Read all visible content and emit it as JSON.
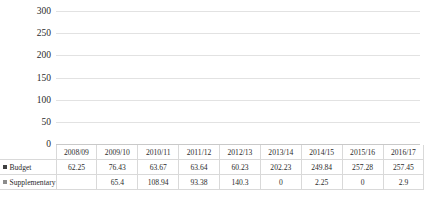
{
  "chart_data": {
    "type": "bar",
    "title": "",
    "xlabel": "",
    "ylabel": "UGX in Billions",
    "ylim": [
      0,
      300
    ],
    "y_ticks": [
      0,
      50,
      100,
      150,
      200,
      250,
      300
    ],
    "grid": true,
    "legend_position": "data-table-row-headers",
    "categories": [
      "2008/09",
      "2009/10",
      "2010/11",
      "2011/12",
      "2012/13",
      "2013/14",
      "2014/15",
      "2015/16",
      "2016/17"
    ],
    "series": [
      {
        "name": "Budget",
        "color": "#404040",
        "values": [
          62.25,
          76.43,
          63.67,
          63.64,
          60.23,
          202.23,
          249.84,
          257.28,
          257.45
        ],
        "labels": [
          "62.25",
          "76.43",
          "63.67",
          "63.64",
          "60.23",
          "202.23",
          "249.84",
          "257.28",
          "257.45"
        ]
      },
      {
        "name": "Supplementary",
        "color": "#8c8c8c",
        "values": [
          null,
          65.4,
          108.94,
          93.38,
          140.3,
          0,
          2.25,
          0,
          2.9
        ],
        "labels": [
          "",
          "65.4",
          "108.94",
          "93.38",
          "140.3",
          "0",
          "2.25",
          "0",
          "2.9"
        ]
      }
    ]
  },
  "icons": {
    "budget_swatch": "square-marker-icon",
    "supplementary_swatch": "square-marker-icon"
  }
}
